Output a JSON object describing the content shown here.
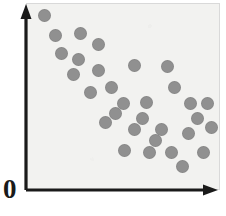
{
  "figure": {
    "name": "scatter-plot-negative-correlation",
    "origin_label": "0",
    "background_color": "#ffffff",
    "panel_color": "#f2f2f0",
    "panel_border_color": "#d9d9d9",
    "axis_color": "#1a1a1a",
    "dot_color": "#909090"
  },
  "chart_data": {
    "type": "scatter",
    "title": "",
    "subtitle": "",
    "xlabel": "",
    "ylabel": "",
    "xlim": [
      0,
      100
    ],
    "ylim": [
      0,
      100
    ],
    "grid": false,
    "legend": null,
    "annotations": [
      {
        "text": "0",
        "x": 0,
        "y": 0,
        "position": "origin"
      }
    ],
    "axis_arrows": {
      "x": "right",
      "y": "up"
    },
    "point_count": 31,
    "relationship": "negative",
    "series": [
      {
        "name": "observations",
        "marker": "circle",
        "color": "#909090",
        "marker_size": 13,
        "points": [
          {
            "x": 9,
            "y": 94
          },
          {
            "x": 15,
            "y": 83
          },
          {
            "x": 28,
            "y": 84
          },
          {
            "x": 37,
            "y": 78
          },
          {
            "x": 18,
            "y": 73
          },
          {
            "x": 27,
            "y": 70
          },
          {
            "x": 37,
            "y": 64
          },
          {
            "x": 56,
            "y": 67
          },
          {
            "x": 73,
            "y": 66
          },
          {
            "x": 44,
            "y": 55
          },
          {
            "x": 77,
            "y": 55
          },
          {
            "x": 50,
            "y": 46
          },
          {
            "x": 62,
            "y": 47
          },
          {
            "x": 85,
            "y": 46
          },
          {
            "x": 94,
            "y": 46
          },
          {
            "x": 41,
            "y": 36
          },
          {
            "x": 56,
            "y": 32
          },
          {
            "x": 70,
            "y": 32
          },
          {
            "x": 84,
            "y": 30
          },
          {
            "x": 96,
            "y": 33
          },
          {
            "x": 51,
            "y": 21
          },
          {
            "x": 64,
            "y": 20
          },
          {
            "x": 75,
            "y": 20
          },
          {
            "x": 92,
            "y": 20
          },
          {
            "x": 81,
            "y": 12
          },
          {
            "x": 33,
            "y": 52
          },
          {
            "x": 46,
            "y": 41
          },
          {
            "x": 60,
            "y": 38
          },
          {
            "x": 89,
            "y": 38
          },
          {
            "x": 24,
            "y": 62
          },
          {
            "x": 67,
            "y": 26
          }
        ]
      }
    ]
  }
}
